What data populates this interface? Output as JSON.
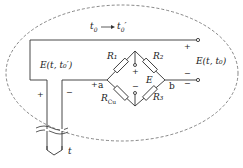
{
  "diagram": {
    "title_annotation": "t₀ → t₀′",
    "labels": {
      "left_emf": "E(t, t₀′)",
      "right_emf": "E(t, t₀)",
      "bridge_emf": "E",
      "r1": "R₁",
      "r2": "R₂",
      "r3": "R₃",
      "rcu": "R",
      "rcu_sub": "Cu",
      "node_a": "a",
      "node_b": "b",
      "probe_temp": "t",
      "plus": "+",
      "minus": "−"
    },
    "colors": {
      "line": "#333333",
      "dashed": "#555555"
    }
  }
}
